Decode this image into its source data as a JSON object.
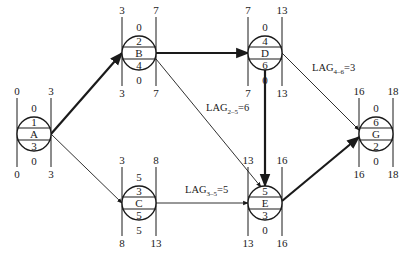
{
  "diagram": {
    "type": "single-code network (activity-on-node) with time parameters",
    "colors": {
      "line": "#1a1a1a",
      "background": "#ffffff"
    },
    "nodes": [
      {
        "id": "A",
        "number": "1",
        "label": "A",
        "duration": "3",
        "top_float": "0",
        "bottom_float": "0",
        "top_left": "0",
        "top_right": "3",
        "bottom_left": "0",
        "bottom_right": "3"
      },
      {
        "id": "B",
        "number": "2",
        "label": "B",
        "duration": "4",
        "top_float": "0",
        "bottom_float": "0",
        "top_left": "3",
        "top_right": "7",
        "bottom_left": "3",
        "bottom_right": "7"
      },
      {
        "id": "C",
        "number": "3",
        "label": "C",
        "duration": "5",
        "top_float": "5",
        "bottom_float": "5",
        "top_left": "3",
        "top_right": "8",
        "bottom_left": "8",
        "bottom_right": "13"
      },
      {
        "id": "D",
        "number": "4",
        "label": "D",
        "duration": "6",
        "top_float": "0",
        "bottom_float": "0",
        "top_left": "7",
        "top_right": "13",
        "bottom_left": "7",
        "bottom_right": "13"
      },
      {
        "id": "E",
        "number": "5",
        "label": "E",
        "duration": "3",
        "top_float": "0",
        "bottom_float": "0",
        "top_left": "13",
        "top_right": "16",
        "bottom_left": "13",
        "bottom_right": "16"
      },
      {
        "id": "G",
        "number": "6",
        "label": "G",
        "duration": "2",
        "top_float": "0",
        "bottom_float": "0",
        "top_left": "16",
        "top_right": "18",
        "bottom_left": "16",
        "bottom_right": "18"
      }
    ],
    "edges": [
      {
        "from": "A",
        "to": "B",
        "critical": true
      },
      {
        "from": "A",
        "to": "C",
        "critical": false
      },
      {
        "from": "B",
        "to": "D",
        "critical": true
      },
      {
        "from": "B",
        "to": "E",
        "critical": false
      },
      {
        "from": "C",
        "to": "E",
        "critical": false
      },
      {
        "from": "D",
        "to": "E",
        "critical": true
      },
      {
        "from": "D",
        "to": "G",
        "critical": false
      },
      {
        "from": "E",
        "to": "G",
        "critical": true
      }
    ],
    "lag_labels": [
      {
        "id": "lag-4-6",
        "prefix": "LAG",
        "sub": "4–6",
        "value": "=3"
      },
      {
        "id": "lag-2-5",
        "prefix": "LAG",
        "sub": "2–5",
        "value": "=6"
      },
      {
        "id": "lag-3-5",
        "prefix": "LAG",
        "sub": "3–5",
        "value": "=5"
      }
    ]
  }
}
